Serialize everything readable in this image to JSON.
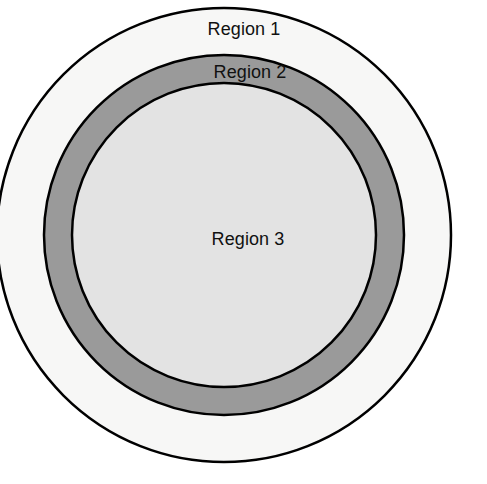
{
  "diagram": {
    "type": "concentric-circles",
    "background_color": "#ffffff",
    "stroke_color": "#000000",
    "stroke_width": 2.5,
    "center": {
      "x": 224,
      "y": 235
    },
    "labels": {
      "region_1": "Region 1",
      "region_2": "Region 2",
      "region_3": "Region 3"
    },
    "regions": [
      {
        "id": "region-1",
        "label": "Region 1",
        "shape": "annulus",
        "fill_color": "#f7f7f6",
        "outer_radius": 228,
        "inner_radius": 180,
        "label_position": "top-band"
      },
      {
        "id": "region-2",
        "label": "Region 2",
        "shape": "annulus",
        "fill_color": "#9a9a9a",
        "outer_radius": 180,
        "inner_radius": 152,
        "label_position": "upper-band"
      },
      {
        "id": "region-3",
        "label": "Region 3",
        "shape": "disc",
        "fill_color": "#e3e3e3",
        "outer_radius": 152,
        "inner_radius": 0,
        "label_position": "center"
      }
    ]
  },
  "chart_data": {
    "type": "pie",
    "subtitle": "",
    "xlabel": "",
    "ylabel": "",
    "legend_position": "inline-labels",
    "grid": false,
    "categories": [
      "Region 1",
      "Region 2",
      "Region 3"
    ],
    "values": [
      228,
      180,
      152
    ],
    "value_unit": "radius-px",
    "colors": [
      "#f7f7f6",
      "#9a9a9a",
      "#e3e3e3"
    ],
    "annotations": [
      "Region 1",
      "Region 2",
      "Region 3"
    ]
  }
}
